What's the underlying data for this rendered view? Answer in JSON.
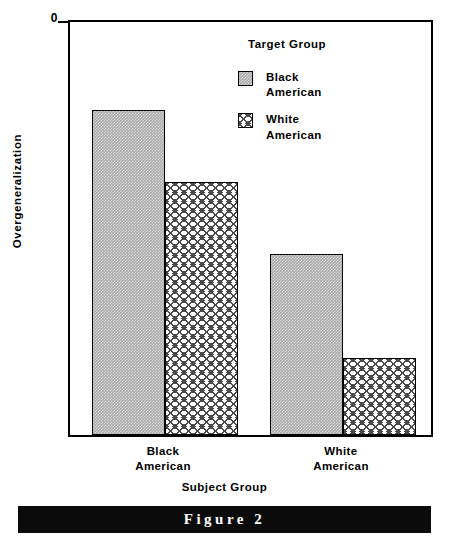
{
  "chart_data": {
    "type": "bar",
    "title": "",
    "xlabel": "Subject   Group",
    "ylabel": "Overgeneralization",
    "ylim": [
      0,
      8
    ],
    "yticks": [
      0,
      2,
      4,
      6,
      8
    ],
    "ytick_labels": [
      "0",
      "2",
      "4",
      "6",
      "8"
    ],
    "grid": false,
    "legend_position": "upper right",
    "legend_title": "Target   Group",
    "categories": [
      "Black\nAmerican",
      "White\nAmerican"
    ],
    "category_labels_flat": [
      "Black American",
      "White American"
    ],
    "series": [
      {
        "name": "Black\nAmerican",
        "name_flat": "Black American",
        "values": [
          6.3,
          3.5
        ],
        "fill": "gray-checker",
        "color": "#a8a8a8"
      },
      {
        "name": "White\nAmerican",
        "name_flat": "White American",
        "values": [
          4.9,
          1.5
        ],
        "fill": "diagonal-crosshatch",
        "color": "#ffffff"
      }
    ]
  },
  "legend": {
    "title": "Target   Group",
    "entries": [
      {
        "label": "Black\nAmerican",
        "swatch": "gray-checker-swatch"
      },
      {
        "label": "White\nAmerican",
        "swatch": "crosshatch-swatch"
      }
    ]
  },
  "axes": {
    "y_label": "Overgeneralization",
    "x_label": "Subject   Group",
    "y_ticks": [
      "8",
      "6",
      "4",
      "2",
      "0"
    ]
  },
  "x_categories": [
    {
      "label": "Black\nAmerican"
    },
    {
      "label": "White\nAmerican"
    }
  ],
  "caption": {
    "text": "Figure 2"
  },
  "colors": {
    "bar_series_1": "#a8a8a8",
    "bar_series_2": "#ffffff",
    "hatch": "#4a4a4a",
    "axis": "#000000",
    "caption_bar": "#0b0b0b",
    "caption_text": "#ffffff"
  }
}
